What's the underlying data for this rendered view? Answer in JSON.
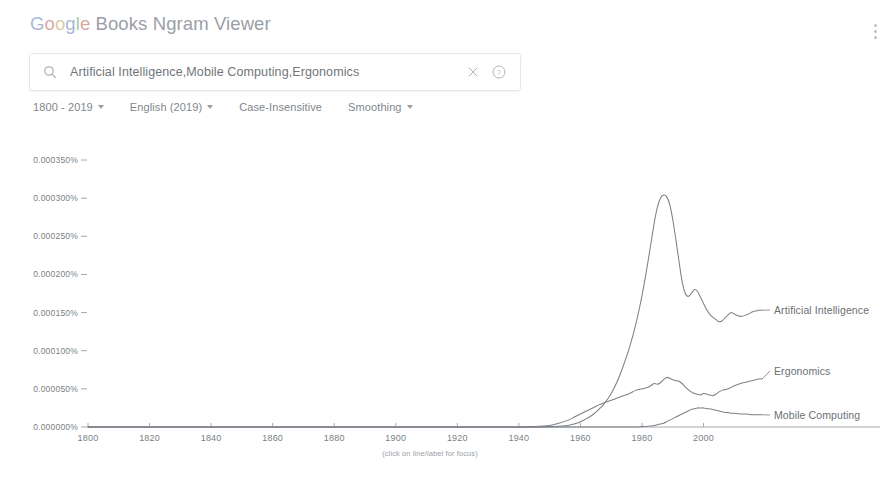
{
  "header": {
    "title": "Google Books Ngram Viewer",
    "title_parts": [
      "G",
      "o",
      "o",
      "g",
      "l",
      "e",
      " Books Ngram Viewer"
    ],
    "kebab_icon": "more-vert-icon"
  },
  "search": {
    "value": "Artificial Intelligence,Mobile Computing,Ergonomics",
    "placeholder": "",
    "search_icon": "search-icon",
    "clear_icon": "close-icon",
    "help_icon": "help-circle-icon"
  },
  "options": [
    {
      "label": "1800 - 2019",
      "has_caret": true,
      "name": "year-range-selector"
    },
    {
      "label": "English (2019)",
      "has_caret": true,
      "name": "corpus-selector"
    },
    {
      "label": "Case-Insensitive",
      "has_caret": false,
      "name": "case-insensitive-toggle"
    },
    {
      "label": "Smoothing",
      "has_caret": true,
      "name": "smoothing-selector"
    }
  ],
  "chart_note": "(click on line/label for focus)",
  "chart_data": {
    "type": "line",
    "title": "",
    "xlabel": "",
    "ylabel": "",
    "xlim": [
      1800,
      2019
    ],
    "ylim": [
      0.0,
      0.00035
    ],
    "grid": false,
    "legend_position": "right-inline-labels",
    "y_tick_labels": [
      "0.000350%",
      "0.000300%",
      "0.000250%",
      "0.000200%",
      "0.000150%",
      "0.000100%",
      "0.000050%",
      "0.000000%"
    ],
    "y_ticks": [
      0.00035,
      0.0003,
      0.00025,
      0.0002,
      0.00015,
      0.0001,
      5e-05,
      0.0
    ],
    "x_tick_labels": [
      "1800",
      "1820",
      "1840",
      "1860",
      "1880",
      "1900",
      "1920",
      "1940",
      "1960",
      "1980",
      "2000"
    ],
    "x_ticks": [
      1800,
      1820,
      1840,
      1860,
      1880,
      1900,
      1920,
      1940,
      1960,
      1980,
      2000
    ],
    "x": [
      1800,
      1810,
      1820,
      1830,
      1840,
      1850,
      1860,
      1870,
      1880,
      1890,
      1900,
      1905,
      1910,
      1915,
      1920,
      1925,
      1930,
      1935,
      1940,
      1945,
      1950,
      1953,
      1956,
      1958,
      1960,
      1962,
      1964,
      1966,
      1968,
      1970,
      1972,
      1974,
      1976,
      1978,
      1980,
      1982,
      1984,
      1985,
      1986,
      1987,
      1988,
      1989,
      1990,
      1991,
      1992,
      1993,
      1994,
      1995,
      1996,
      1997,
      1998,
      1999,
      2000,
      2001,
      2002,
      2003,
      2004,
      2005,
      2006,
      2007,
      2008,
      2009,
      2010,
      2012,
      2014,
      2016,
      2018,
      2019
    ],
    "series": [
      {
        "name": "Artificial Intelligence",
        "color": "#7c8187",
        "values": [
          0,
          0,
          0,
          0,
          0,
          0,
          0,
          0,
          0,
          0,
          0,
          0,
          0,
          0,
          0,
          0,
          0,
          0,
          0,
          0,
          5e-07,
          1e-06,
          2e-06,
          4e-06,
          7e-06,
          1.1e-05,
          1.6e-05,
          2.3e-05,
          3.2e-05,
          4.4e-05,
          6e-05,
          8.1e-05,
          0.000105,
          0.000135,
          0.000172,
          0.000218,
          0.000268,
          0.000288,
          0.0003,
          0.000304,
          0.000302,
          0.000292,
          0.000272,
          0.000246,
          0.000218,
          0.000192,
          0.000176,
          0.000171,
          0.000175,
          0.00018,
          0.000178,
          0.00017,
          0.000162,
          0.000154,
          0.000148,
          0.000144,
          0.000141,
          0.000138,
          0.000139,
          0.000143,
          0.000147,
          0.00015,
          0.000148,
          0.000145,
          0.000147,
          0.000151,
          0.000153,
          0.000153
        ]
      },
      {
        "name": "Ergonomics",
        "color": "#7c8187",
        "values": [
          0,
          0,
          0,
          0,
          0,
          0,
          0,
          0,
          0,
          0,
          0,
          0,
          0,
          0,
          0,
          0,
          0,
          0,
          0,
          5e-07,
          2e-06,
          5e-06,
          9e-06,
          1.3e-05,
          1.7e-05,
          2.1e-05,
          2.5e-05,
          2.9e-05,
          3.2e-05,
          3.5e-05,
          3.8e-05,
          4.1e-05,
          4.4e-05,
          4.8e-05,
          5e-05,
          5.2e-05,
          5.7e-05,
          5.6e-05,
          5.8e-05,
          6.2e-05,
          6.5e-05,
          6.4e-05,
          6.2e-05,
          6.1e-05,
          6e-05,
          5.7e-05,
          5.3e-05,
          4.9e-05,
          4.6e-05,
          4.4e-05,
          4.3e-05,
          4.2e-05,
          4.4e-05,
          4.3e-05,
          4.2e-05,
          4.1e-05,
          4.3e-05,
          4.6e-05,
          4.8e-05,
          4.9e-05,
          5e-05,
          5.2e-05,
          5.4e-05,
          5.7e-05,
          5.9e-05,
          6.1e-05,
          6.3e-05,
          6.3e-05
        ]
      },
      {
        "name": "Mobile Computing",
        "color": "#7c8187",
        "values": [
          0,
          0,
          0,
          0,
          0,
          0,
          0,
          0,
          0,
          0,
          0,
          0,
          0,
          0,
          0,
          0,
          0,
          0,
          0,
          0,
          0,
          0,
          0,
          0,
          0,
          0,
          0,
          0,
          0,
          0,
          0,
          0,
          0,
          0,
          5e-07,
          1e-06,
          2e-06,
          3e-06,
          4e-06,
          5e-06,
          7e-06,
          9e-06,
          1.1e-05,
          1.3e-05,
          1.5e-05,
          1.7e-05,
          1.9e-05,
          2.1e-05,
          2.3e-05,
          2.4e-05,
          2.5e-05,
          2.5e-05,
          2.5e-05,
          2.4e-05,
          2.4e-05,
          2.3e-05,
          2.2e-05,
          2.1e-05,
          2e-05,
          1.9e-05,
          1.9e-05,
          1.8e-05,
          1.8e-05,
          1.7e-05,
          1.7e-05,
          1.6e-05,
          1.6e-05,
          1.6e-05
        ]
      }
    ]
  }
}
